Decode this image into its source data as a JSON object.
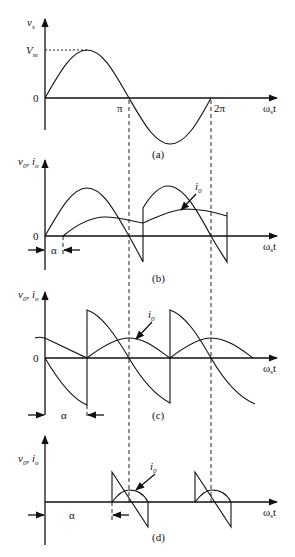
{
  "figure": {
    "panels": [
      {
        "id": "a",
        "caption": "(a)",
        "y_label": "v",
        "y_label_sub": "s",
        "peak_label": "V",
        "peak_label_sub": "m",
        "origin_label": "0",
        "x_ticks": [
          "π",
          "2π"
        ],
        "x_label": "ω",
        "x_label_sub": "s",
        "x_label_tail": "t"
      },
      {
        "id": "b",
        "caption": "(b)",
        "y_label": "v",
        "y_label_sub": "0",
        "y_label_2": ", i",
        "y_label_2_sub": "o",
        "origin_label": "0",
        "alpha_label": "α",
        "current_label": "i",
        "current_label_sub": "0",
        "x_label": "ω",
        "x_label_sub": "s",
        "x_label_tail": "t"
      },
      {
        "id": "c",
        "caption": "(c)",
        "y_label": "v",
        "y_label_sub": "0",
        "y_label_2": ", i",
        "y_label_2_sub": "o",
        "origin_label": "0",
        "alpha_label": "α",
        "current_label": "i",
        "current_label_sub": "0",
        "x_label": "ω",
        "x_label_sub": "s",
        "x_label_tail": "t"
      },
      {
        "id": "d",
        "caption": "(d)",
        "y_label": "v",
        "y_label_sub": "0",
        "y_label_2": ", i",
        "y_label_2_sub": "o",
        "alpha_label": "α",
        "current_label": "i",
        "current_label_sub": "0",
        "x_label": "ω",
        "x_label_sub": "s",
        "x_label_tail": "t"
      }
    ]
  }
}
